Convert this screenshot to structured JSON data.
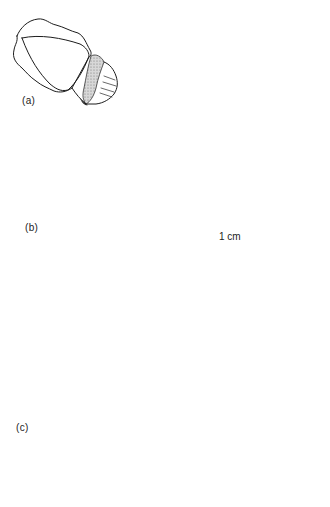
{
  "figure": {
    "panels": [
      {
        "id": "a",
        "label": "(a)"
      },
      {
        "id": "b",
        "label": "(b)"
      },
      {
        "id": "c",
        "label": "(c)"
      }
    ],
    "scale_bar": {
      "label": "1 cm"
    },
    "colors": {
      "ink": "#1c1c1c",
      "stipple": "#c9c9c9",
      "background": "#ffffff"
    }
  }
}
